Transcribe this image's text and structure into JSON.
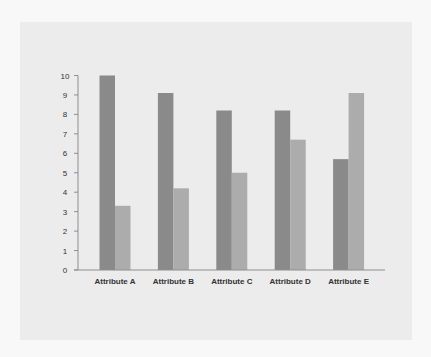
{
  "chart_data": {
    "type": "bar",
    "title": "",
    "xlabel": "",
    "ylabel": "",
    "categories": [
      "Attribute A",
      "Attribute B",
      "Attribute C",
      "Attribute D",
      "Attribute E"
    ],
    "series": [
      {
        "name": "Series 1",
        "values": [
          10,
          9.1,
          8.2,
          8.2,
          5.7
        ],
        "color": "#8a8a8a"
      },
      {
        "name": "Series 2",
        "values": [
          3.3,
          4.2,
          5.0,
          6.7,
          9.1
        ],
        "color": "#acacac"
      }
    ],
    "ylim": [
      0,
      10
    ],
    "yticks": [
      0,
      1,
      2,
      3,
      4,
      5,
      6,
      7,
      8,
      9,
      10
    ],
    "grid": false,
    "legend": "none"
  }
}
